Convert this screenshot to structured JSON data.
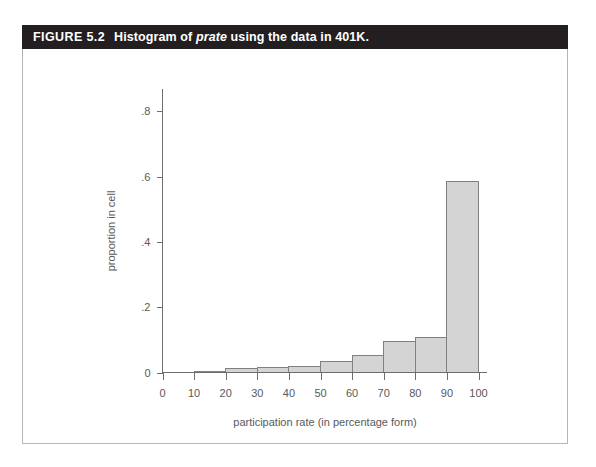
{
  "figure": {
    "number_label": "FIGURE 5.2",
    "caption_part1": "Histogram of ",
    "caption_italic": "prate",
    "caption_part2": " using the data in 401K."
  },
  "colors": {
    "title_bar_background": "#231f20",
    "title_text": "#ffffff",
    "bar_fill": "#d4d4d4",
    "bar_stroke": "#808080",
    "axis": "#6e6e6e",
    "tick_label": "#58595b",
    "frame_border": "#b5b5b5",
    "page_background": "#ffffff"
  },
  "chart_data": {
    "type": "bar",
    "title": "Histogram of prate using the data in 401K.",
    "xlabel": "participation rate (in percentage form)",
    "ylabel": "proportion in cell",
    "xlim": [
      0,
      100
    ],
    "ylim": [
      0,
      0.9
    ],
    "grid": false,
    "legend": "none",
    "bin_width": 10,
    "bin_edges": [
      0,
      10,
      20,
      30,
      40,
      50,
      60,
      70,
      80,
      90,
      100
    ],
    "categories": [
      "0-10",
      "10-20",
      "20-30",
      "30-40",
      "40-50",
      "50-60",
      "60-70",
      "70-80",
      "80-90",
      "90-100"
    ],
    "values": [
      0.001,
      0.002,
      0.011,
      0.014,
      0.018,
      0.033,
      0.051,
      0.095,
      0.107,
      0.585
    ],
    "xticks": [
      0,
      10,
      20,
      30,
      40,
      50,
      60,
      70,
      80,
      90,
      100
    ],
    "xtick_labels": [
      "0",
      "10",
      "20",
      "30",
      "40",
      "50",
      "60",
      "70",
      "80",
      "90",
      "100"
    ],
    "yticks": [
      0,
      0.2,
      0.4,
      0.6,
      0.8
    ],
    "ytick_labels": [
      "0",
      ".2",
      ".4",
      ".6",
      ".8"
    ]
  }
}
